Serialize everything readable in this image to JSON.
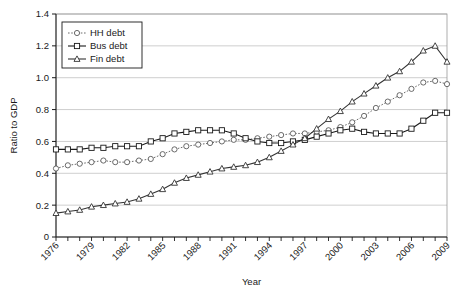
{
  "chart_data": {
    "type": "line",
    "title": "",
    "xlabel": "Year",
    "ylabel": "Ratio to GDP",
    "xlim": [
      1976,
      2009
    ],
    "ylim": [
      0,
      1.4
    ],
    "ytick_step": 0.2,
    "xtick_step": 1,
    "xtick_label_step": 3,
    "grid": true,
    "legend_position": "top-left",
    "ytick_labels": [
      "0",
      "0.2",
      "0.4",
      "0.6",
      "0.8",
      "1.0",
      "1.2",
      "1.4"
    ],
    "ytick_values": [
      0,
      0.2,
      0.4,
      0.6,
      0.8,
      1.0,
      1.2,
      1.4
    ],
    "xtick_labels": [
      "1976",
      "1979",
      "1982",
      "1985",
      "1988",
      "1991",
      "1994",
      "1997",
      "2000",
      "2003",
      "2006",
      "2009"
    ],
    "x": [
      1976,
      1977,
      1978,
      1979,
      1980,
      1981,
      1982,
      1983,
      1984,
      1985,
      1986,
      1987,
      1988,
      1989,
      1990,
      1991,
      1992,
      1993,
      1994,
      1995,
      1996,
      1997,
      1998,
      1999,
      2000,
      2001,
      2002,
      2003,
      2004,
      2005,
      2006,
      2007,
      2008,
      2009
    ],
    "series": [
      {
        "name": "HH debt",
        "marker": "circle",
        "line_style": "dotted",
        "color": "#5a5a5a",
        "values": [
          0.43,
          0.45,
          0.46,
          0.47,
          0.48,
          0.47,
          0.47,
          0.48,
          0.49,
          0.52,
          0.55,
          0.57,
          0.58,
          0.59,
          0.6,
          0.61,
          0.61,
          0.62,
          0.63,
          0.64,
          0.65,
          0.65,
          0.66,
          0.67,
          0.69,
          0.72,
          0.76,
          0.81,
          0.85,
          0.89,
          0.93,
          0.97,
          0.98,
          0.96
        ]
      },
      {
        "name": "Bus debt",
        "marker": "square",
        "line_style": "solid",
        "color": "#1a1a1a",
        "values": [
          0.55,
          0.55,
          0.55,
          0.56,
          0.56,
          0.57,
          0.57,
          0.57,
          0.6,
          0.62,
          0.65,
          0.66,
          0.67,
          0.67,
          0.67,
          0.65,
          0.62,
          0.6,
          0.59,
          0.59,
          0.6,
          0.61,
          0.63,
          0.65,
          0.67,
          0.68,
          0.66,
          0.65,
          0.65,
          0.65,
          0.68,
          0.73,
          0.78,
          0.78
        ]
      },
      {
        "name": "Fin debt",
        "marker": "triangle",
        "line_style": "solid",
        "color": "#333333",
        "values": [
          0.15,
          0.16,
          0.17,
          0.19,
          0.2,
          0.21,
          0.22,
          0.24,
          0.27,
          0.3,
          0.34,
          0.37,
          0.39,
          0.41,
          0.43,
          0.44,
          0.45,
          0.47,
          0.5,
          0.54,
          0.58,
          0.62,
          0.68,
          0.74,
          0.79,
          0.85,
          0.9,
          0.95,
          1.0,
          1.04,
          1.1,
          1.17,
          1.2,
          1.1
        ]
      }
    ]
  },
  "legend": {
    "items": [
      {
        "label": "HH debt"
      },
      {
        "label": "Bus debt"
      },
      {
        "label": "Fin debt"
      }
    ]
  }
}
